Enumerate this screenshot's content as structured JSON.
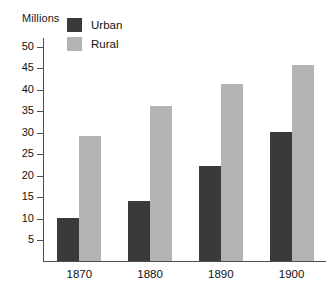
{
  "chart_data": {
    "type": "bar",
    "title": "",
    "ylabel": "Millions",
    "xlabel": "",
    "categories": [
      "1870",
      "1880",
      "1890",
      "1900"
    ],
    "series": [
      {
        "name": "Urban",
        "color": "#3a3a3a",
        "values": [
          10,
          14,
          22,
          30
        ]
      },
      {
        "name": "Rural",
        "color": "#b3b3b3",
        "values": [
          29,
          36,
          41,
          45.5
        ]
      }
    ],
    "ylim": [
      0,
      52
    ],
    "yticks": [
      5,
      10,
      15,
      20,
      25,
      30,
      35,
      40,
      45,
      50
    ],
    "ytick_labels": [
      "5",
      "10",
      "15",
      "20",
      "25",
      "30",
      "35",
      "40",
      "45",
      "50"
    ],
    "grid": false,
    "legend_position": "top-left-inside",
    "axis_color": "#4d4d4d",
    "text_color": "#111111",
    "background": "#ffffff"
  },
  "legend": {
    "entries": [
      {
        "label": "Urban",
        "swatch_name": "legend-swatch-urban"
      },
      {
        "label": "Rural",
        "swatch_name": "legend-swatch-rural"
      }
    ]
  }
}
